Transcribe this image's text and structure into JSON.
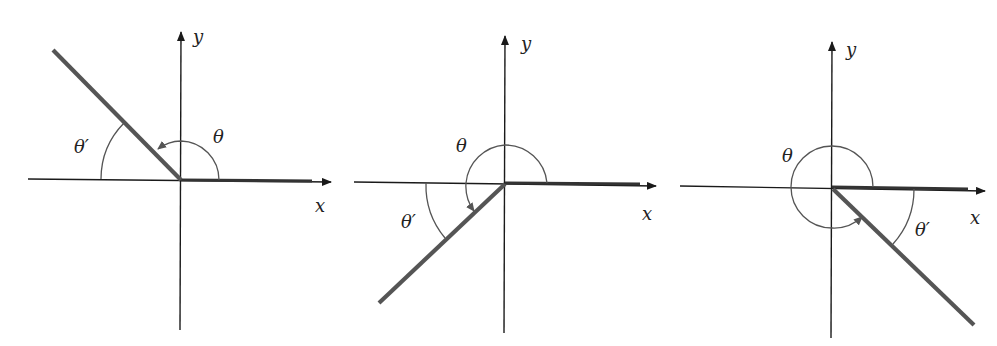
{
  "figure": {
    "colors": {
      "axis": "#1a1a1a",
      "terminal_side": "#555555",
      "arc": "#555555",
      "background": "#ffffff"
    },
    "panels": [
      {
        "id": "quadrant-II",
        "x_label": "x",
        "y_label": "y",
        "theta_label": "θ",
        "reference_label": "θ′",
        "terminal_angle_deg": 135
      },
      {
        "id": "quadrant-III",
        "x_label": "x",
        "y_label": "y",
        "theta_label": "θ",
        "reference_label": "θ′",
        "terminal_angle_deg": 220
      },
      {
        "id": "quadrant-IV",
        "x_label": "x",
        "y_label": "y",
        "theta_label": "θ",
        "reference_label": "θ′",
        "terminal_angle_deg": 315
      }
    ]
  }
}
